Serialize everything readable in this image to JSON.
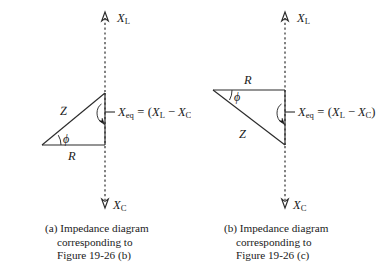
{
  "figure": {
    "background_color": "#ffffff",
    "ink_color": "#1a1a1a",
    "panels": [
      {
        "id": "a",
        "axis_top_label": {
          "base": "X",
          "sub": "L"
        },
        "axis_bottom_label": {
          "base": "X",
          "sub": "C"
        },
        "hypotenuse_label": "Z",
        "base_label": "R",
        "angle_label": "ϕ",
        "equation": {
          "lhs_base": "X",
          "lhs_sub": "eq",
          "equals": "=",
          "open_paren": "(",
          "term1_base": "X",
          "term1_sub": "L",
          "minus": "−",
          "term2_base": "X",
          "term2_sub": "C",
          "close_paren": ")",
          "full_text": "Xeq = (XL - XC)"
        },
        "caption_lines": [
          "(a) Impedance diagram",
          "corresponding to",
          "Figure 19-26 (b)"
        ],
        "triangle": {
          "orientation": "R horizontal at bottom, Z rising left-to-right, right angle at bottom-right",
          "vertices": [
            [
              42,
              145
            ],
            [
              105,
              145
            ],
            [
              105,
              93
            ]
          ]
        }
      },
      {
        "id": "b",
        "axis_top_label": {
          "base": "X",
          "sub": "L"
        },
        "axis_bottom_label": {
          "base": "X",
          "sub": "C"
        },
        "hypotenuse_label": "Z",
        "base_label": "R",
        "angle_label": "ϕ",
        "equation": {
          "lhs_base": "X",
          "lhs_sub": "eq",
          "equals": "=",
          "open_paren": "(",
          "term1_base": "X",
          "term1_sub": "L",
          "minus": "−",
          "term2_base": "X",
          "term2_sub": "C",
          "close_paren": ")",
          "full_text": "Xeq = (XL - XC)"
        },
        "caption_lines": [
          "(b) Impedance diagram",
          "corresponding to",
          "Figure 19-26 (c)"
        ],
        "triangle": {
          "orientation": "R horizontal at top, Z descending left-to-right, right angle at top-right",
          "vertices": [
            [
              21,
              90
            ],
            [
              93,
              90
            ],
            [
              93,
              145
            ]
          ]
        }
      }
    ]
  }
}
